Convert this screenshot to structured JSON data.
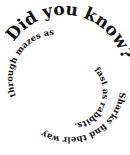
{
  "spiral_text": {
    "heading": "Did you know?",
    "body": "Sharks find their way through mazes as fast as rabbits."
  },
  "colors": {
    "text": "#111111",
    "background": "#ffffff"
  }
}
